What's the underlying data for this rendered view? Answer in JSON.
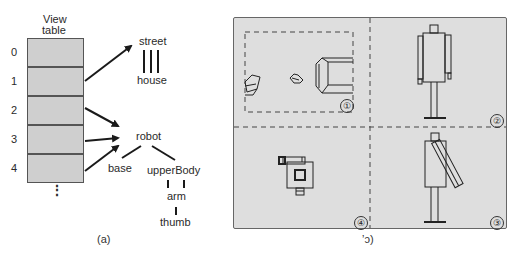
{
  "panel_a": {
    "table_title_line1": "View",
    "table_title_line2": "table",
    "indices": [
      "0",
      "1",
      "2",
      "3",
      "4"
    ],
    "ellipsis": "⋮",
    "tree1": {
      "root": "street",
      "child": "house"
    },
    "tree2": {
      "root": "robot",
      "children": [
        "base",
        "upperBody"
      ],
      "grandchild": "arm",
      "great_grandchild": "thumb"
    },
    "caption": "(a)"
  },
  "panel_b": {
    "quadrant_labels": [
      "①",
      "②",
      "③",
      "④"
    ],
    "caption": "ʼɔ)"
  },
  "colors": {
    "table_fill": "#cfcfcf",
    "panel_fill": "#dedede",
    "line": "#222222"
  }
}
